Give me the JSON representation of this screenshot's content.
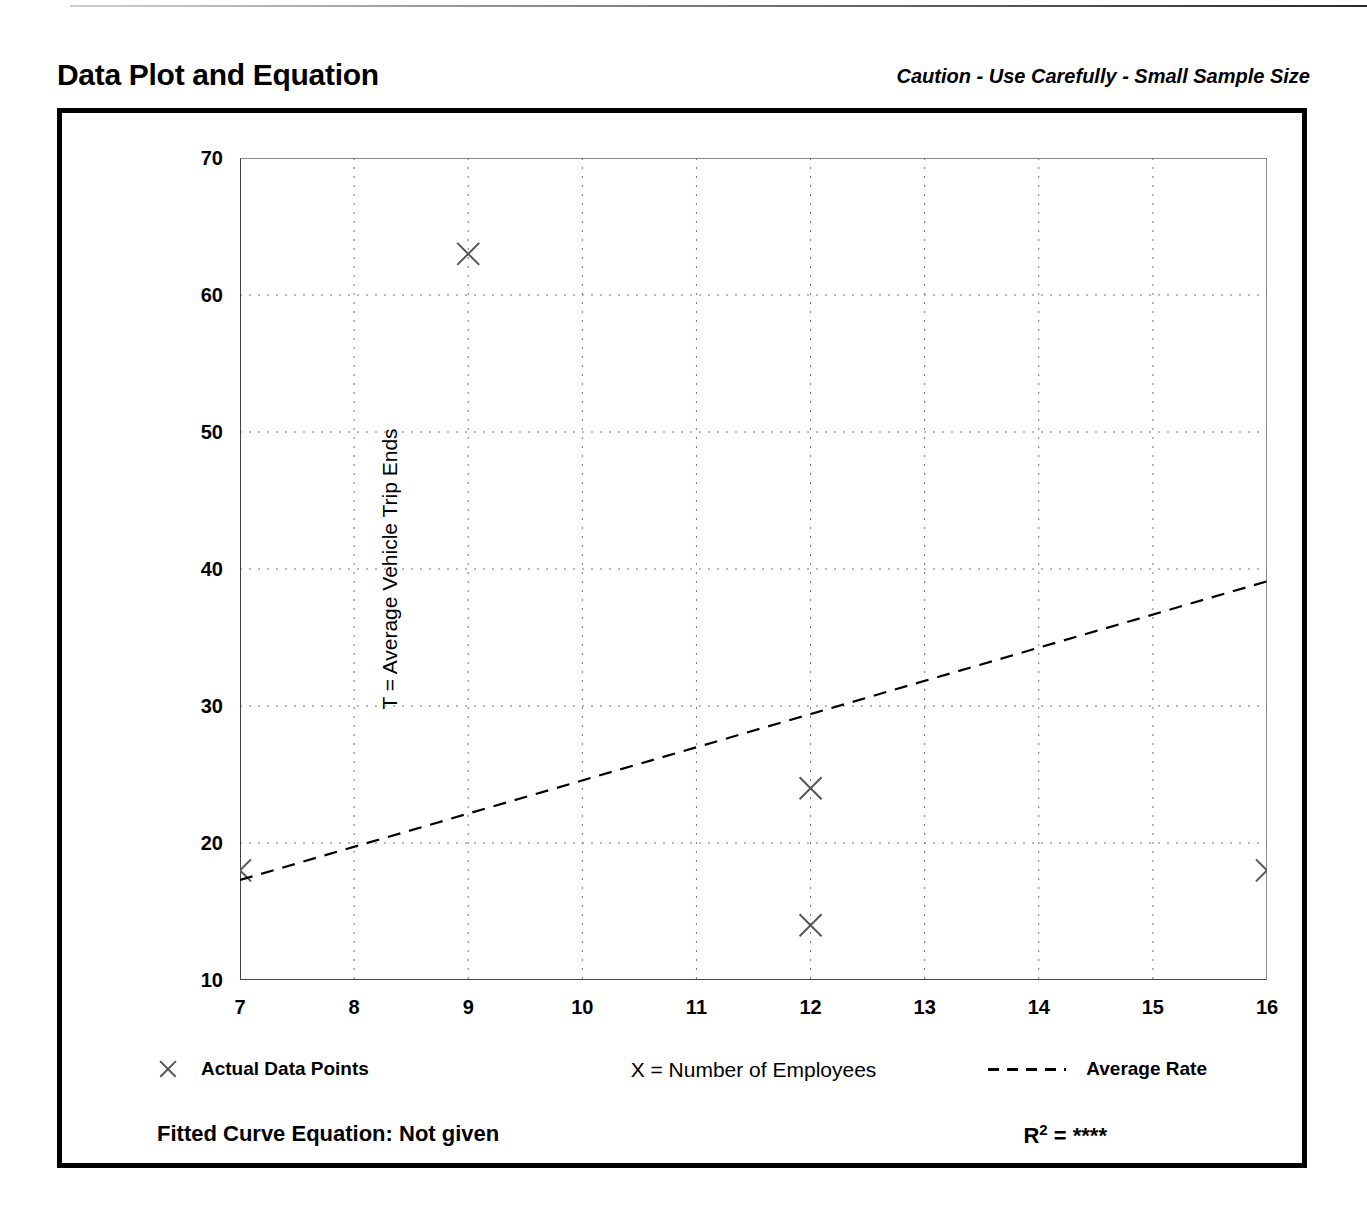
{
  "header": {
    "title": "Data Plot and Equation",
    "caution": "Caution - Use Carefully - Small Sample Size"
  },
  "legend": {
    "data_points_label": "Actual Data Points",
    "average_rate_label": "Average Rate",
    "marker_icon": "x-marker-icon",
    "line_icon": "dashed-line-icon"
  },
  "equation": {
    "fitted_curve_label": "Fitted Curve Equation:  Not given",
    "r_squared_prefix": "R",
    "r_squared_exponent": "2",
    "r_squared_value": "= ****"
  },
  "chart_data": {
    "type": "scatter",
    "title": "Data Plot and Equation",
    "xlabel": "X = Number of Employees",
    "ylabel": "T = Average Vehicle Trip Ends",
    "xlim": [
      7,
      16
    ],
    "ylim": [
      10,
      70
    ],
    "x_ticks": [
      7,
      8,
      9,
      10,
      11,
      12,
      13,
      14,
      15,
      16
    ],
    "x_tick_labels": [
      "7",
      "8",
      "9",
      "10",
      "11",
      "12",
      "13",
      "14",
      "15",
      "16"
    ],
    "x_minor_ticks": [
      7.5,
      8.5,
      9.5,
      10.5,
      11.5,
      12.5,
      13.5,
      14.5,
      15.5
    ],
    "y_ticks": [
      10,
      20,
      30,
      40,
      50,
      60,
      70
    ],
    "y_tick_labels": [
      "10",
      "20",
      "30",
      "40",
      "50",
      "60",
      "70"
    ],
    "y_minor_ticks": [
      15,
      25,
      35,
      45,
      55,
      65
    ],
    "grid": true,
    "grid_style": "dotted",
    "legend_position": "below-plot",
    "series": [
      {
        "name": "Actual Data Points",
        "type": "scatter",
        "marker": "x",
        "color": "#555555",
        "points": [
          {
            "x": 7,
            "y": 18
          },
          {
            "x": 9,
            "y": 63
          },
          {
            "x": 12,
            "y": 24
          },
          {
            "x": 12,
            "y": 14
          },
          {
            "x": 16,
            "y": 18
          }
        ]
      },
      {
        "name": "Average Rate",
        "type": "line",
        "style": "dashed",
        "color": "#000000",
        "points": [
          {
            "x": 7,
            "y": 17.3
          },
          {
            "x": 16,
            "y": 39.1
          }
        ]
      }
    ]
  }
}
